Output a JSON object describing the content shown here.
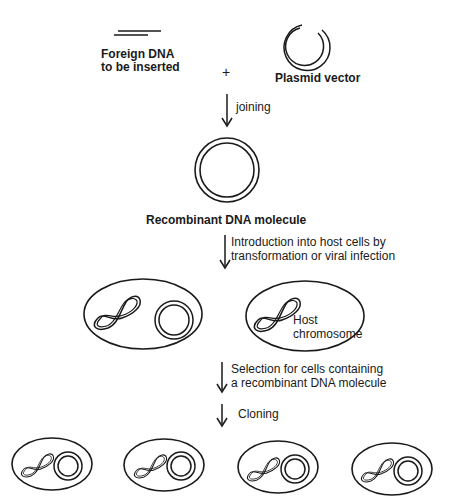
{
  "diagram": {
    "inputs": {
      "foreign_dna_label_line1": "Foreign DNA",
      "foreign_dna_label_line2": "to be inserted",
      "plus_sign": "+",
      "plasmid_label": "Plasmid vector"
    },
    "steps": [
      {
        "label_line1": "joining",
        "label_line2": ""
      },
      {
        "label_line1": "Introduction into host cells by",
        "label_line2": "transformation or viral infection"
      },
      {
        "label_line1": "Selection for cells containing",
        "label_line2": "a recombinant DNA molecule"
      },
      {
        "label_line1": "Cloning",
        "label_line2": ""
      }
    ],
    "recombinant_label": "Recombinant DNA molecule",
    "host_cell_labels": {
      "line1": "Host",
      "line2": "chromosome"
    },
    "clone_count": 4,
    "stroke_color": "#1a1a1a",
    "background_color": "#ffffff"
  }
}
